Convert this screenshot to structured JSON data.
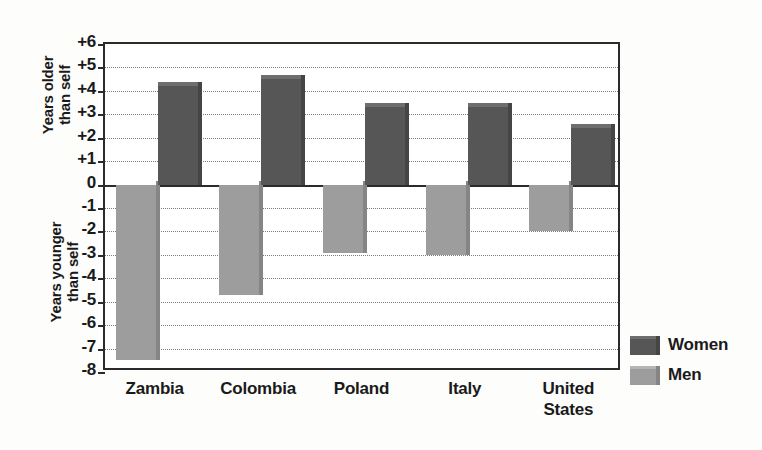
{
  "chart_data": {
    "type": "bar",
    "title": "",
    "subtitle": "",
    "xlabel": "",
    "ylabel_upper": "Years older\nthan self",
    "ylabel_lower": "Years younger\nthan self",
    "categories": [
      "Zambia",
      "Colombia",
      "Poland",
      "Italy",
      "United\nStates"
    ],
    "series": [
      {
        "name": "Women",
        "color": "#565656",
        "values": [
          4.2,
          4.5,
          3.3,
          3.3,
          2.4
        ]
      },
      {
        "name": "Men",
        "color": "#9d9d9d",
        "values": [
          -7.5,
          -4.7,
          -2.9,
          -3.0,
          -2.0
        ]
      }
    ],
    "ylim": [
      -8,
      6
    ],
    "yticks": [
      6,
      5,
      4,
      3,
      2,
      1,
      0,
      -1,
      -2,
      -3,
      -4,
      -5,
      -6,
      -7,
      -8
    ],
    "ytick_labels": [
      "+6",
      "+5",
      "+4",
      "+3",
      "+2",
      "+1",
      "0",
      "-1",
      "-2",
      "-3",
      "-4",
      "-5",
      "-6",
      "-7",
      "-8"
    ],
    "grid": true,
    "grid_style": "dotted",
    "zero_line": 0,
    "legend_position": "right-bottom",
    "bar_order": [
      "Men",
      "Women"
    ]
  },
  "legend": {
    "entries": [
      {
        "label": "Women",
        "swatch_class": "women"
      },
      {
        "label": "Men",
        "swatch_class": "men"
      }
    ]
  },
  "colors": {
    "women": "#565656",
    "men": "#9d9d9d",
    "axis": "#2b2b2b",
    "grid": "#7a7a7a",
    "background": "#fdfdfc"
  }
}
